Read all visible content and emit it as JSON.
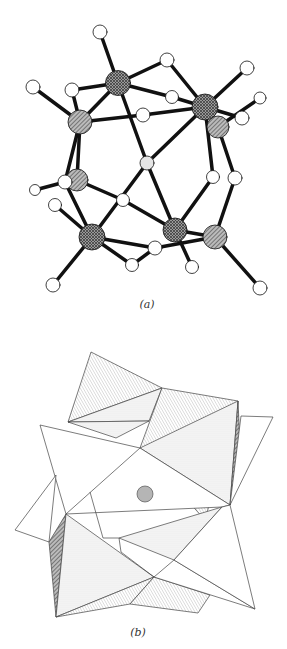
{
  "figure": {
    "panel_a": {
      "caption": "(a)",
      "description": "Ball-and-stick molecular cluster structure",
      "colors": {
        "bond": "#111111",
        "large_atom": "#8a8a8a",
        "small_atom": "#ffffff",
        "center_atom": "#dddddd"
      }
    },
    "panel_b": {
      "caption": "(b)",
      "description": "Polyhedral representation with central atom",
      "colors": {
        "edge": "#444444",
        "shaded_face": "#e4e4e4",
        "dark_face": "#bdbdbd",
        "center_atom": "#b5b5b5"
      }
    }
  }
}
